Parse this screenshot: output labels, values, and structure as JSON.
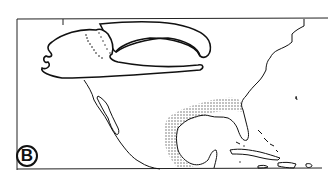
{
  "figure": {
    "panel_label": "B",
    "map_region": "Gulf of Mexico and Caribbean",
    "colors": {
      "line": "#111111",
      "stipple": "#555555",
      "background": "#ffffff"
    },
    "layers": [
      {
        "name": "claw-drawing",
        "description": "outline of crab claw (chela) with dotted row of teeth"
      },
      {
        "name": "coastline-map",
        "description": "North America, Mexico, Florida, Cuba, Caribbean islands"
      },
      {
        "name": "distribution-stipple",
        "description": "stippled range along northern and western Gulf coast"
      }
    ]
  }
}
